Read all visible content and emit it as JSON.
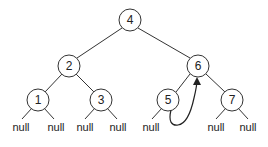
{
  "diagram": {
    "type": "threaded-binary-search-tree",
    "nodes": [
      {
        "id": "n4",
        "label": "4",
        "x": 130,
        "y": 20
      },
      {
        "id": "n2",
        "label": "2",
        "x": 69,
        "y": 66
      },
      {
        "id": "n6",
        "label": "6",
        "x": 198,
        "y": 66
      },
      {
        "id": "n1",
        "label": "1",
        "x": 38,
        "y": 100
      },
      {
        "id": "n3",
        "label": "3",
        "x": 101,
        "y": 100
      },
      {
        "id": "n5",
        "label": "5",
        "x": 168,
        "y": 100
      },
      {
        "id": "n7",
        "label": "7",
        "x": 232,
        "y": 100
      }
    ],
    "null_labels": [
      {
        "parent": "1",
        "side": "left",
        "text": "null"
      },
      {
        "parent": "1",
        "side": "right",
        "text": "null"
      },
      {
        "parent": "3",
        "side": "left",
        "text": "null"
      },
      {
        "parent": "3",
        "side": "right",
        "text": "null"
      },
      {
        "parent": "5",
        "side": "left",
        "text": "null"
      },
      {
        "parent": "7",
        "side": "left",
        "text": "null"
      },
      {
        "parent": "7",
        "side": "right",
        "text": "null"
      }
    ],
    "edges": [
      [
        "4",
        "2"
      ],
      [
        "4",
        "6"
      ],
      [
        "2",
        "1"
      ],
      [
        "2",
        "3"
      ],
      [
        "6",
        "5"
      ],
      [
        "6",
        "7"
      ]
    ],
    "thread": {
      "from": "5",
      "to": "6",
      "description": "right null pointer of 5 threaded to in-order successor 6"
    }
  }
}
